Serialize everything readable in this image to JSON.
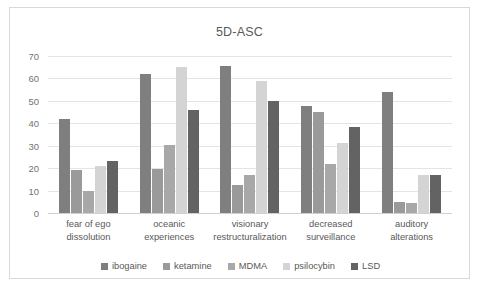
{
  "chart_data": {
    "type": "bar",
    "title": "5D-ASC",
    "xlabel": "",
    "ylabel": "",
    "ylim": [
      0,
      70
    ],
    "ytick_step": 10,
    "yticks": [
      70,
      60,
      50,
      40,
      30,
      20,
      10,
      0
    ],
    "grid": true,
    "legend_position": "bottom",
    "categories": [
      "fear of ego dissolution",
      "oceanic experiences",
      "visionary restructuralization",
      "decreased surveillance",
      "auditory alterations"
    ],
    "category_lines": [
      [
        "fear of ego",
        "dissolution"
      ],
      [
        "oceanic",
        "experiences"
      ],
      [
        "visionary",
        "restructuralization"
      ],
      [
        "decreased",
        "surveillance"
      ],
      [
        "auditory",
        "alterations"
      ]
    ],
    "series": [
      {
        "name": "ibogaine",
        "color": "#7f7f7f",
        "values": [
          42,
          62,
          65.5,
          47.5,
          54
        ]
      },
      {
        "name": "ketamine",
        "color": "#9a9a9a",
        "values": [
          19,
          19.5,
          12.5,
          45,
          5
        ]
      },
      {
        "name": "MDMA",
        "color": "#a8a8a8",
        "values": [
          10,
          30.5,
          17,
          22,
          4.5
        ]
      },
      {
        "name": "psilocybin",
        "color": "#d4d4d4",
        "values": [
          21,
          65,
          59,
          31,
          17
        ]
      },
      {
        "name": "LSD",
        "color": "#636363",
        "values": [
          23,
          46,
          50,
          38.5,
          17
        ]
      }
    ]
  },
  "colors": {
    "frame_border": "#d9d9d9",
    "gridline": "#e4e4e4",
    "text": "#595959",
    "background": "#ffffff"
  }
}
